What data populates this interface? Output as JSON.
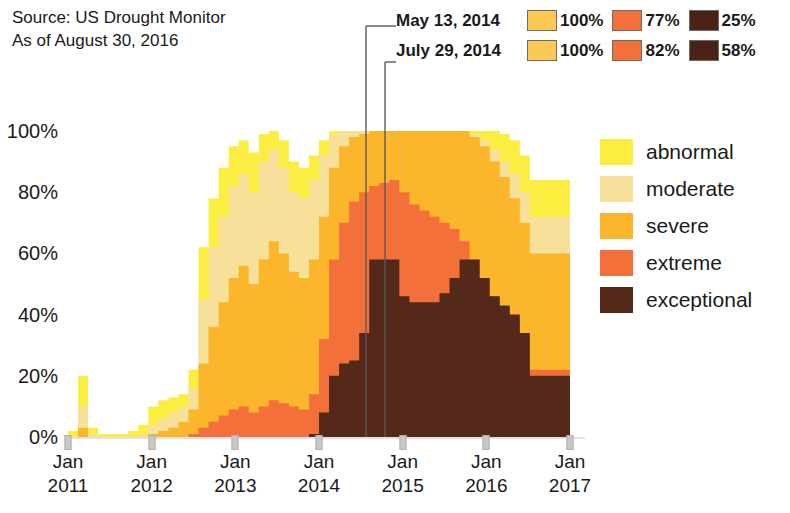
{
  "source": {
    "line1": "Source: US Drought Monitor",
    "line2": "As of August 30, 2016"
  },
  "annotations": [
    {
      "date": "May 13, 2014",
      "x_pixel": 366,
      "values": [
        {
          "label": "100%",
          "color": "#fcc955"
        },
        {
          "label": "77%",
          "color": "#f4703a"
        },
        {
          "label": "25%",
          "color": "#4a2216"
        }
      ]
    },
    {
      "date": "July 29, 2014",
      "x_pixel": 385,
      "values": [
        {
          "label": "100%",
          "color": "#fcc955"
        },
        {
          "label": "82%",
          "color": "#f4703a"
        },
        {
          "label": "58%",
          "color": "#4a2216"
        }
      ]
    }
  ],
  "legend": {
    "items": [
      {
        "label": "abnormal",
        "color": "#fcee40"
      },
      {
        "label": "moderate",
        "color": "#f7e09a"
      },
      {
        "label": "severe",
        "color": "#fbb62b"
      },
      {
        "label": "extreme",
        "color": "#f4703a"
      },
      {
        "label": "exceptional",
        "color": "#54291a"
      }
    ]
  },
  "chart_data": {
    "type": "area",
    "title": "",
    "xlabel": "",
    "ylabel": "",
    "stacked": true,
    "grid": false,
    "legend_position": "right",
    "ylim": [
      0,
      100
    ],
    "ytick_labels": [
      "0%",
      "20%",
      "40%",
      "60%",
      "80%",
      "100%"
    ],
    "ytick_values": [
      0,
      20,
      40,
      60,
      80,
      100
    ],
    "xtick_labels": [
      "Jan\n2011",
      "Jan\n2012",
      "Jan\n2013",
      "Jan\n2014",
      "Jan\n2015",
      "Jan\n2016",
      "Jan\n2017"
    ],
    "xtick_lines": [
      {
        "l1": "Jan",
        "l2": "2011"
      },
      {
        "l1": "Jan",
        "l2": "2012"
      },
      {
        "l1": "Jan",
        "l2": "2013"
      },
      {
        "l1": "Jan",
        "l2": "2014"
      },
      {
        "l1": "Jan",
        "l2": "2015"
      },
      {
        "l1": "Jan",
        "l2": "2016"
      },
      {
        "l1": "Jan",
        "l2": "2017"
      }
    ],
    "xlim": [
      "2011-01-01",
      "2017-01-01"
    ],
    "x_fractions": [
      0,
      0.02,
      0.04,
      0.06,
      0.08,
      0.1,
      0.12,
      0.14,
      0.16,
      0.18,
      0.2,
      0.22,
      0.24,
      0.26,
      0.28,
      0.3,
      0.32,
      0.34,
      0.36,
      0.38,
      0.4,
      0.42,
      0.44,
      0.46,
      0.48,
      0.5,
      0.52,
      0.54,
      0.56,
      0.58,
      0.6,
      0.62,
      0.64,
      0.66,
      0.68,
      0.7,
      0.72,
      0.74,
      0.76,
      0.78,
      0.8,
      0.82,
      0.84,
      0.86,
      0.88,
      0.9,
      0.92
    ],
    "series": [
      {
        "name": "abnormal",
        "color": "#fcee40",
        "values": [
          2,
          20,
          3,
          1,
          1,
          1,
          2,
          4,
          10,
          12,
          13,
          14,
          22,
          62,
          78,
          88,
          95,
          97,
          93,
          99,
          100,
          97,
          90,
          88,
          92,
          97,
          100,
          100,
          100,
          100,
          100,
          100,
          100,
          100,
          100,
          100,
          100,
          100,
          100,
          100,
          100,
          100,
          100,
          99,
          97,
          92,
          84
        ]
      },
      {
        "name": "moderate",
        "color": "#f7e09a",
        "values": [
          0,
          10,
          1,
          0,
          0,
          0,
          0,
          1,
          4,
          6,
          8,
          10,
          16,
          45,
          62,
          72,
          82,
          86,
          80,
          90,
          94,
          88,
          80,
          78,
          84,
          92,
          99,
          100,
          100,
          100,
          100,
          100,
          100,
          100,
          100,
          100,
          100,
          100,
          100,
          100,
          99,
          97,
          94,
          90,
          86,
          80,
          72
        ]
      },
      {
        "name": "severe",
        "color": "#fbb62b",
        "values": [
          0,
          3,
          0,
          0,
          0,
          0,
          0,
          0,
          1,
          2,
          3,
          5,
          9,
          24,
          36,
          44,
          52,
          56,
          50,
          58,
          64,
          60,
          54,
          52,
          58,
          72,
          88,
          95,
          98,
          99,
          100,
          100,
          100,
          100,
          100,
          100,
          100,
          100,
          100,
          100,
          98,
          95,
          90,
          85,
          78,
          70,
          60
        ]
      },
      {
        "name": "extreme",
        "color": "#f4703a",
        "values": [
          0,
          0,
          0,
          0,
          0,
          0,
          0,
          0,
          0,
          0,
          0,
          0,
          1,
          3,
          5,
          7,
          9,
          10,
          8,
          10,
          12,
          11,
          10,
          9,
          14,
          32,
          58,
          70,
          77,
          80,
          82,
          83,
          84,
          80,
          76,
          74,
          72,
          70,
          68,
          64,
          58,
          52,
          46,
          42,
          38,
          32,
          22
        ]
      },
      {
        "name": "exceptional",
        "color": "#54291a",
        "values": [
          0,
          0,
          0,
          0,
          0,
          0,
          0,
          0,
          0,
          0,
          0,
          0,
          0,
          0,
          0,
          0,
          0,
          0,
          0,
          0,
          0,
          0,
          0,
          0,
          1,
          8,
          20,
          24,
          25,
          34,
          58,
          58,
          58,
          46,
          44,
          44,
          44,
          47,
          52,
          58,
          58,
          52,
          46,
          43,
          40,
          34,
          20
        ]
      }
    ]
  },
  "plot_geometry": {
    "left": 68,
    "right": 570,
    "top": 131,
    "bottom": 437,
    "axis_right_edge": 585
  }
}
